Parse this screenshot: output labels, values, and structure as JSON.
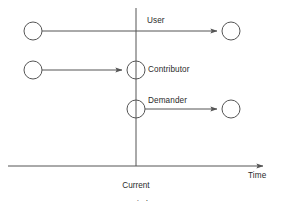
{
  "figure": {
    "type": "timeline-diagram",
    "background_color": "#ffffff",
    "line_color": "#555555",
    "text_color": "#2b2b2b"
  },
  "axes": {
    "horizontal": {
      "label": "Time",
      "y": 166,
      "x_start": 8,
      "x_end": 267,
      "arrow": "right"
    },
    "vertical": {
      "label": "Current\nPeriod",
      "label_line1": "Current",
      "label_line2": "Period",
      "x": 136,
      "y_start": 8,
      "y_end": 166
    }
  },
  "actors": [
    {
      "id": "user",
      "label": "User",
      "row_y": 31,
      "start_node": {
        "cx": 33,
        "cy": 31,
        "r": 9
      },
      "end_node": {
        "cx": 231,
        "cy": 31,
        "r": 9
      },
      "arrow_from_x": 42,
      "arrow_to_x": 221,
      "label_x": 147,
      "label_y": 18,
      "crosses_current_period": true
    },
    {
      "id": "contributor",
      "label": "Contributor",
      "row_y": 70,
      "start_node": {
        "cx": 33,
        "cy": 70,
        "r": 9
      },
      "end_node": {
        "cx": 136,
        "cy": 70,
        "r": 9
      },
      "arrow_from_x": 42,
      "arrow_to_x": 126,
      "label_x": 148,
      "label_y": 65,
      "crosses_current_period": false
    },
    {
      "id": "demander",
      "label": "Demander",
      "row_y": 109,
      "start_node": {
        "cx": 136,
        "cy": 109,
        "r": 9
      },
      "end_node": {
        "cx": 231,
        "cy": 109,
        "r": 9
      },
      "arrow_from_x": 145,
      "arrow_to_x": 221,
      "label_x": 148,
      "label_y": 97,
      "crosses_current_period": false
    }
  ]
}
